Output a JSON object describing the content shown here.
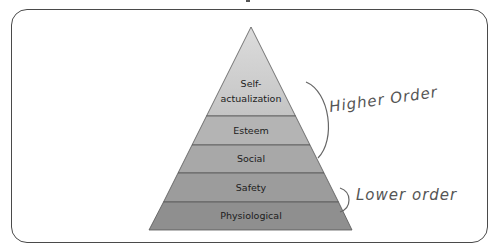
{
  "diagram": {
    "type": "pyramid",
    "levels": [
      {
        "label_line1": "Self-",
        "label_line2": "actualization",
        "color": "#c8c8c8"
      },
      {
        "label": "Esteem",
        "color": "#b5b5b5"
      },
      {
        "label": "Social",
        "color": "#a9a9a9"
      },
      {
        "label": "Safety",
        "color": "#9c9c9c"
      },
      {
        "label": "Physiological",
        "color": "#8e8e8e"
      }
    ],
    "annotations": {
      "higher": "Higher Order",
      "lower": "Lower order"
    },
    "colors": {
      "outline": "#4a4a4a",
      "handwriting": "#555555"
    }
  }
}
